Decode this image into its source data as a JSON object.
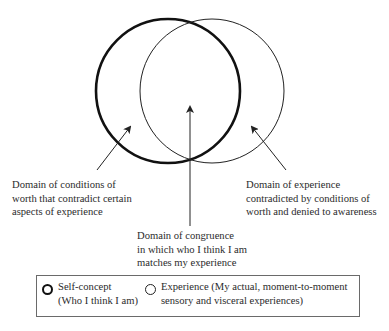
{
  "diagram": {
    "title": "",
    "circles": [
      {
        "id": "self-concept",
        "cx": 168,
        "cy": 91,
        "r": 72,
        "stroke_width": 2.6,
        "color": "#111111"
      },
      {
        "id": "experience",
        "cx": 212,
        "cy": 91,
        "r": 72,
        "stroke_width": 1,
        "color": "#222222"
      }
    ],
    "labels": {
      "left": {
        "lines": [
          "Domain of conditions of",
          "worth that contradict certain",
          "aspects of experience"
        ]
      },
      "right": {
        "lines": [
          "Domain of experience",
          "contradicted by conditions of",
          "worth and denied to awareness"
        ]
      },
      "center": {
        "lines": [
          "Domain of congruence",
          "in which who I think I am",
          "matches my experience"
        ]
      }
    },
    "legend": {
      "items": [
        {
          "symbol": "thick-circle",
          "lines": [
            "Self-concept",
            "(Who I think I am)"
          ]
        },
        {
          "symbol": "thin-circle",
          "lines": [
            "Experience (My actual, moment-to-moment",
            "sensory and visceral experiences)"
          ]
        }
      ]
    }
  }
}
